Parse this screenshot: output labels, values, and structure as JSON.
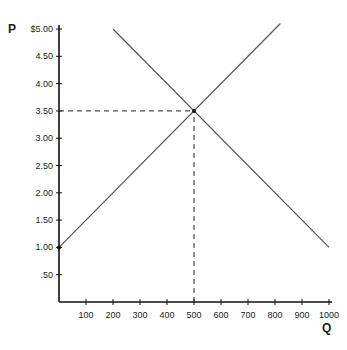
{
  "chart_data": {
    "type": "line",
    "title": "",
    "xlabel": "Q",
    "ylabel": "P",
    "xlim": [
      0,
      1000
    ],
    "ylim": [
      0,
      5
    ],
    "grid": false,
    "x_ticks": [
      100,
      200,
      300,
      400,
      500,
      600,
      700,
      800,
      900,
      1000
    ],
    "x_tick_labels": [
      "100",
      "200",
      "300",
      "400",
      "500",
      "600",
      "700",
      "800",
      "900",
      "1000"
    ],
    "y_ticks": [
      0.5,
      1.0,
      1.5,
      2.0,
      2.5,
      3.0,
      3.5,
      4.0,
      4.5,
      5.0
    ],
    "y_tick_labels": [
      ".50",
      "1.00",
      "1.50",
      "2.00",
      "2.50",
      "3.00",
      "3.50",
      "4.00",
      "4.50",
      "$5.00"
    ],
    "series": [
      {
        "name": "Supply",
        "x": [
          0,
          820
        ],
        "y": [
          1.0,
          5.1
        ]
      },
      {
        "name": "Demand",
        "x": [
          200,
          1000
        ],
        "y": [
          5.0,
          1.0
        ]
      }
    ],
    "annotations": [
      {
        "type": "equilibrium-point",
        "x": 500,
        "y": 3.5
      },
      {
        "type": "dashed-guide-horizontal",
        "y": 3.5,
        "x_from": 0,
        "x_to": 500
      },
      {
        "type": "dashed-guide-vertical",
        "x": 500,
        "y_from": 0,
        "y_to": 3.5
      },
      {
        "type": "point",
        "x": 0,
        "y": 1.0
      }
    ]
  }
}
